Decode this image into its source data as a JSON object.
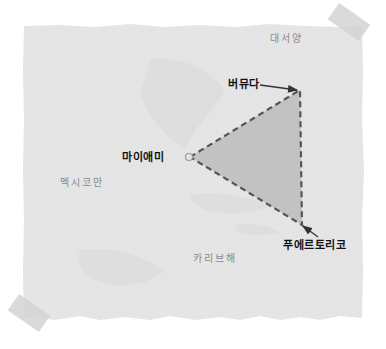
{
  "map": {
    "colors": {
      "page_background": "#ffffff",
      "paper": "#e6e6e6",
      "paper_shadow": "#d8d8d8",
      "tape": "#cfcfcf",
      "triangle_fill": "#c2c2c2",
      "triangle_stroke": "#555555",
      "city_label": "#111111",
      "sea_label": "#8a8a8a"
    },
    "regions": {
      "atlantic_ocean": "대서양",
      "gulf_of_mexico": "멕시코만",
      "caribbean_sea": "카리브해"
    },
    "cities": {
      "bermuda": "버뮤다",
      "miami": "마이애미",
      "puerto_rico": "푸에르토리코"
    },
    "triangle_vertices": {
      "miami": [
        190,
        157
      ],
      "bermuda": [
        300,
        90
      ],
      "puerto_rico": [
        302,
        225
      ]
    },
    "icons": {
      "miami_marker": "circle-marker-icon",
      "bermuda_pointer": "arrow-icon",
      "puerto_rico_pointer": "arrow-icon"
    }
  }
}
